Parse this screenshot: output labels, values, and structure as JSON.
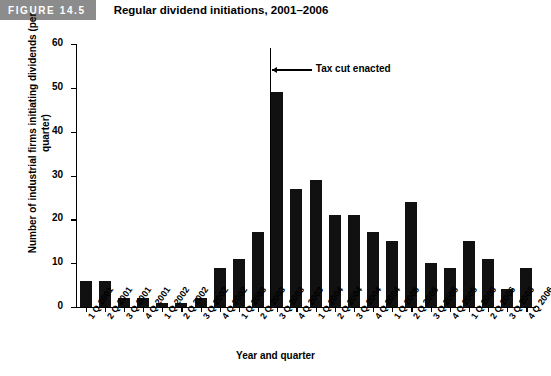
{
  "figure": {
    "badge": "FIGURE 14.5",
    "title": "Regular dividend initiations, 2001–2006",
    "badge_color": "#8c8c8c",
    "bar_color": "#111111"
  },
  "chart_data": {
    "type": "bar",
    "title": "Regular dividend initiations, 2001–2006",
    "xlabel": "Year and quarter",
    "ylabel": "Number of industrial firms initiating dividends (per quarter)",
    "ylim": [
      0,
      60
    ],
    "yticks": [
      0,
      10,
      20,
      30,
      40,
      50,
      60
    ],
    "grid": false,
    "legend": "none",
    "categories": [
      "1 Q 2001",
      "2 Q 2001",
      "3 Q 2001",
      "4 Q 2001",
      "1 Q 2002",
      "2 Q 2002",
      "3 Q 2002",
      "4 Q 2002",
      "1 Q 2003",
      "2 Q 2003",
      "3 Q 2003",
      "4 Q 2003",
      "1 Q 2004",
      "2 Q 2004",
      "3 Q 2004",
      "4 Q 2004",
      "1 Q 2005",
      "2 Q 2005",
      "3 Q 2005",
      "4 Q 2005",
      "1 Q 2006",
      "2 Q 2006",
      "3 Q 2006",
      "4 Q 2006"
    ],
    "values": [
      6,
      6,
      2,
      2,
      1,
      1,
      2,
      9,
      11,
      17,
      49,
      27,
      29,
      21,
      21,
      17,
      15,
      24,
      10,
      9,
      15,
      11,
      4,
      9
    ],
    "annotations": [
      {
        "label": "Tax cut enacted",
        "category": "3 Q 2003",
        "marker": "vertical-line",
        "value": 59
      }
    ]
  }
}
